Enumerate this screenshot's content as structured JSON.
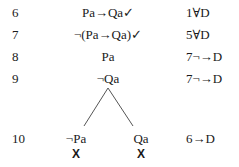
{
  "tableau": {
    "rows": [
      {
        "line": "6",
        "formula": "Pa→Qa✓",
        "justification": "1∀D"
      },
      {
        "line": "7",
        "formula": "¬(Pa→Qa)✓",
        "justification": "5∀D"
      },
      {
        "line": "8",
        "formula": "Pa",
        "justification": "7¬→D"
      },
      {
        "line": "9",
        "formula": "¬Qa",
        "justification": "7¬→D"
      }
    ],
    "branch_row": {
      "line": "10",
      "left_formula": "¬Pa",
      "right_formula": "Qa",
      "justification": "6→D",
      "left_close": "X",
      "right_close": "X"
    }
  }
}
